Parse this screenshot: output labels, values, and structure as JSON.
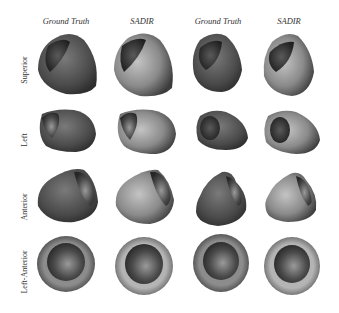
{
  "figure": {
    "column_headers": [
      {
        "label": "Ground Truth",
        "x": 66
      },
      {
        "label": "SADIR",
        "x": 142
      },
      {
        "label": "Ground Truth",
        "x": 218
      },
      {
        "label": "SADIR",
        "x": 289
      }
    ],
    "row_labels": [
      {
        "label": "Superior",
        "y": 70
      },
      {
        "label": "Left",
        "y": 140
      },
      {
        "label": "Anterior",
        "y": 207
      },
      {
        "label": "Left-Anterior",
        "y": 272
      }
    ],
    "shading": {
      "dark": "#3a3a3a",
      "mid": "#6e6e6e",
      "light": "#b8b8b8",
      "cavity": "#2a2a2a"
    }
  }
}
